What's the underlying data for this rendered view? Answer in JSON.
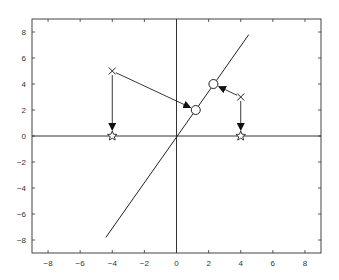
{
  "chart_data": {
    "type": "scatter",
    "title": "",
    "xlabel": "",
    "ylabel": "",
    "xlim": [
      -9,
      9
    ],
    "ylim": [
      -9,
      9
    ],
    "grid": false,
    "legend": null,
    "x_ticks": [
      -8,
      -6,
      -4,
      -2,
      0,
      2,
      4,
      6,
      8
    ],
    "y_ticks": [
      -8,
      -6,
      -4,
      -2,
      0,
      2,
      4,
      6,
      8
    ],
    "x_tick_labels": [
      "−8",
      "−6",
      "−4",
      "−2",
      "0",
      "2",
      "4",
      "6",
      "8"
    ],
    "y_tick_labels": [
      "−8",
      "−6",
      "−4",
      "−2",
      "0",
      "2",
      "4",
      "6",
      "8"
    ],
    "axes_lines": {
      "horizontal_at_y": 0,
      "vertical_at_x": 0
    },
    "line": {
      "name": "projection-line",
      "x": [
        -4.4,
        4.5
      ],
      "y": [
        -7.8,
        7.8
      ]
    },
    "series": [
      {
        "name": "original points",
        "marker": "x",
        "points": [
          [
            -4,
            5
          ],
          [
            4,
            3
          ]
        ]
      },
      {
        "name": "projection onto x-axis",
        "marker": "star",
        "points": [
          [
            -4,
            0
          ],
          [
            4,
            0
          ]
        ]
      },
      {
        "name": "projection onto line",
        "marker": "circle",
        "points": [
          [
            1.2,
            2.0
          ],
          [
            2.3,
            4.0
          ]
        ]
      }
    ],
    "arrows": [
      {
        "from": [
          -4,
          5
        ],
        "to": [
          -4,
          0
        ]
      },
      {
        "from": [
          4,
          3
        ],
        "to": [
          4,
          0
        ]
      },
      {
        "from": [
          -4,
          5
        ],
        "to": [
          1.2,
          2.0
        ]
      },
      {
        "from": [
          4,
          3
        ],
        "to": [
          2.3,
          4.0
        ]
      }
    ],
    "colors": {
      "line": "#222222",
      "axes": "#333333",
      "background": "#ffffff"
    }
  }
}
